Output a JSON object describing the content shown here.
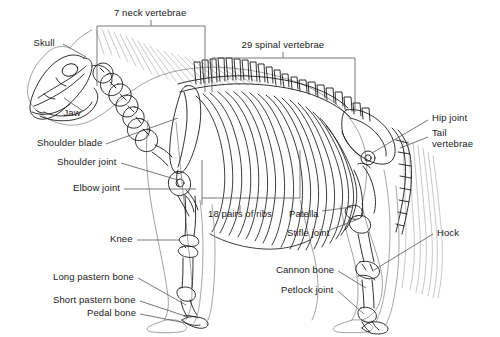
{
  "diagram": {
    "background_color": "#ffffff",
    "line_color": "#1a1a1a",
    "leader_color": "#555555",
    "labels": [
      {
        "id": "neck-vertebrae",
        "text": "7 neck vertebrae",
        "x": 150,
        "y": 13,
        "align": "c"
      },
      {
        "id": "spinal-vertebrae",
        "text": "29 spinal vertebrae",
        "x": 283,
        "y": 45,
        "align": "c"
      },
      {
        "id": "skull",
        "text": "Skull",
        "x": 44,
        "y": 43,
        "align": "c"
      },
      {
        "id": "jaw",
        "text": "Jaw",
        "x": 72,
        "y": 113,
        "align": "c"
      },
      {
        "id": "shoulder-blade",
        "text": "Shoulder blade",
        "x": 102,
        "y": 143,
        "align": "r"
      },
      {
        "id": "shoulder-joint",
        "text": "Shoulder joint",
        "x": 117,
        "y": 162,
        "align": "r"
      },
      {
        "id": "elbow-joint",
        "text": "Elbow joint",
        "x": 120,
        "y": 188,
        "align": "r"
      },
      {
        "id": "knee",
        "text": "Knee",
        "x": 133,
        "y": 239,
        "align": "r"
      },
      {
        "id": "long-pastern-bone",
        "text": "Long pastern bone",
        "x": 134,
        "y": 277,
        "align": "r"
      },
      {
        "id": "short-pastern-bone",
        "text": "Short pastern bone",
        "x": 136,
        "y": 300,
        "align": "r"
      },
      {
        "id": "pedal-bone",
        "text": "Pedal bone",
        "x": 136,
        "y": 313,
        "align": "r"
      },
      {
        "id": "ribs",
        "text": "18 pairs of ribs",
        "x": 240,
        "y": 214,
        "align": "c"
      },
      {
        "id": "patella",
        "text": "Patella",
        "x": 304,
        "y": 214,
        "align": "c"
      },
      {
        "id": "stifle-joint",
        "text": "Stifle joint",
        "x": 308,
        "y": 233,
        "align": "c"
      },
      {
        "id": "cannon-bone",
        "text": "Cannon bone",
        "x": 334,
        "y": 270,
        "align": "r"
      },
      {
        "id": "petlock-joint",
        "text": "Petlock joint",
        "x": 334,
        "y": 290,
        "align": "r"
      },
      {
        "id": "hip-joint",
        "text": "Hip joint",
        "x": 432,
        "y": 118,
        "align": "l"
      },
      {
        "id": "tail-vertebrae-1",
        "text": "Tail",
        "x": 432,
        "y": 133,
        "align": "l"
      },
      {
        "id": "tail-vertebrae-2",
        "text": "vertebrae",
        "x": 432,
        "y": 144,
        "align": "l"
      },
      {
        "id": "hock",
        "text": "Hock",
        "x": 437,
        "y": 233,
        "align": "l"
      }
    ]
  }
}
